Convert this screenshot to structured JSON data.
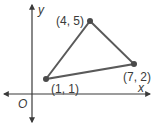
{
  "diagram": {
    "type": "coordinate-plane-triangle",
    "axes": {
      "x_label": "x",
      "y_label": "y",
      "origin_label": "O"
    },
    "points": [
      {
        "label": "(1, 1)",
        "x": 1,
        "y": 1
      },
      {
        "label": "(4, 5)",
        "x": 4,
        "y": 5
      },
      {
        "label": "(7, 2)",
        "x": 7,
        "y": 2
      }
    ],
    "colors": {
      "axis": "#3a3a3a",
      "triangle": "#5a5a5a",
      "point": "#4a4a4a",
      "text": "#3a3a3a"
    }
  }
}
